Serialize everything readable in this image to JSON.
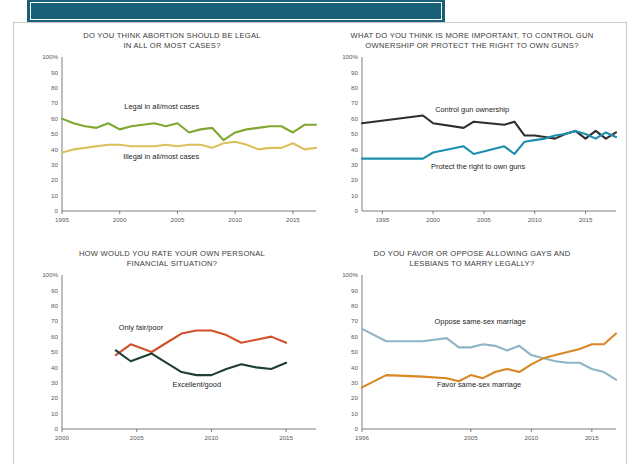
{
  "banner": {
    "title": ""
  },
  "panels": [
    {
      "id": "abortion",
      "title": "DO YOU THINK ABORTION SHOULD BE LEGAL IN ALL OR MOST CASES?",
      "title_line1": "DO YOU THINK ABORTION SHOULD BE LEGAL",
      "title_line2": "IN ALL OR MOST CASES?"
    },
    {
      "id": "guns",
      "title": "WHAT DO YOU THINK IS MORE IMPORTANT, TO CONTROL GUN OWNERSHIP OR PROTECT THE RIGHT TO OWN GUNS?",
      "title_line1": "WHAT DO YOU THINK IS MORE IMPORTANT, TO CONTROL GUN",
      "title_line2": "OWNERSHIP OR PROTECT THE RIGHT TO OWN GUNS?"
    },
    {
      "id": "finance",
      "title": "HOW WOULD YOU RATE YOUR OWN PERSONAL FINANCIAL SITUATION?",
      "title_line1": "HOW WOULD YOU RATE YOUR OWN PERSONAL",
      "title_line2": "FINANCIAL SITUATION?"
    },
    {
      "id": "marriage",
      "title": "DO YOU FAVOR OR OPPOSE ALLOWING GAYS AND LESBIANS TO MARRY LEGALLY?",
      "title_line1": "DO YOU FAVOR OR OPPOSE ALLOWING GAYS AND",
      "title_line2": "LESBIANS TO MARRY LEGALLY?"
    }
  ],
  "chart_data": [
    {
      "id": "abortion",
      "type": "line",
      "title": "DO YOU THINK ABORTION SHOULD BE LEGAL IN ALL OR MOST CASES?",
      "xlabel": "",
      "ylabel": "",
      "ylim": [
        0,
        100
      ],
      "xlim": [
        1995,
        2017
      ],
      "yticks": [
        0,
        10,
        20,
        30,
        40,
        50,
        60,
        70,
        80,
        90,
        100
      ],
      "ytick_labels": [
        "0",
        "10",
        "20",
        "30",
        "40",
        "50",
        "60",
        "70",
        "80",
        "90",
        "100%"
      ],
      "xticks": [
        1995,
        2000,
        2005,
        2010,
        2015
      ],
      "xtick_labels": [
        "1995",
        "2000",
        "2005",
        "2010",
        "2015"
      ],
      "grid": false,
      "legend_position": "inline-annotation",
      "series": [
        {
          "name": "Legal in all/most cases",
          "color": "#7fa830",
          "label_x": 2000.4,
          "label_y": 66,
          "x": [
            1995,
            1996,
            1997,
            1998,
            1999,
            2000,
            2001,
            2002,
            2003,
            2004,
            2005,
            2006,
            2007,
            2008,
            2009,
            2010,
            2011,
            2012,
            2013,
            2014,
            2015,
            2016,
            2017
          ],
          "values": [
            60,
            57,
            55,
            54,
            57,
            53,
            55,
            56,
            57,
            55,
            57,
            51,
            53,
            54,
            46,
            51,
            53,
            54,
            55,
            55,
            51,
            56,
            56
          ]
        },
        {
          "name": "Illegal in all/most cases",
          "color": "#dcc05c",
          "label_x": 2000.3,
          "label_y": 34,
          "x": [
            1995,
            1996,
            1997,
            1998,
            1999,
            2000,
            2001,
            2002,
            2003,
            2004,
            2005,
            2006,
            2007,
            2008,
            2009,
            2010,
            2011,
            2012,
            2013,
            2014,
            2015,
            2016,
            2017
          ],
          "values": [
            38,
            40,
            41,
            42,
            43,
            43,
            42,
            42,
            42,
            43,
            42,
            43,
            43,
            41,
            44,
            45,
            43,
            40,
            41,
            41,
            44,
            40,
            41
          ]
        }
      ]
    },
    {
      "id": "guns",
      "type": "line",
      "title": "WHAT DO YOU THINK IS MORE IMPORTANT, TO CONTROL GUN OWNERSHIP OR PROTECT THE RIGHT TO OWN GUNS?",
      "xlabel": "",
      "ylabel": "",
      "ylim": [
        0,
        100
      ],
      "xlim": [
        1993,
        2018
      ],
      "yticks": [
        0,
        10,
        20,
        30,
        40,
        50,
        60,
        70,
        80,
        90,
        100
      ],
      "ytick_labels": [
        "0",
        "10",
        "20",
        "30",
        "40",
        "50",
        "60",
        "70",
        "80",
        "90",
        "100%"
      ],
      "xticks": [
        1995,
        2000,
        2005,
        2010,
        2015
      ],
      "xtick_labels": [
        "1995",
        "2000",
        "2005",
        "2010",
        "2015"
      ],
      "grid": false,
      "legend_position": "inline-annotation",
      "series": [
        {
          "name": "Control gun ownership",
          "color": "#2e2e2e",
          "label_x": 2000.2,
          "label_y": 64,
          "x": [
            1993,
            1999,
            2000,
            2003,
            2004,
            2007,
            2008,
            2009,
            2010,
            2011,
            2012,
            2013,
            2014,
            2015,
            2016,
            2017,
            2018
          ],
          "values": [
            57,
            62,
            57,
            54,
            58,
            56,
            58,
            49,
            49,
            48,
            47,
            50,
            52,
            47,
            52,
            47,
            51
          ]
        },
        {
          "name": "Protect the right to own guns",
          "color": "#1b8fae",
          "label_x": 1999.8,
          "label_y": 27,
          "x": [
            1993,
            1999,
            2000,
            2003,
            2004,
            2007,
            2008,
            2009,
            2010,
            2011,
            2012,
            2013,
            2014,
            2015,
            2016,
            2017,
            2018
          ],
          "values": [
            34,
            34,
            38,
            42,
            37,
            42,
            37,
            45,
            46,
            47,
            49,
            50,
            52,
            50,
            47,
            51,
            48
          ]
        }
      ]
    },
    {
      "id": "finance",
      "type": "line",
      "title": "HOW WOULD YOU RATE YOUR OWN PERSONAL FINANCIAL SITUATION?",
      "xlabel": "",
      "ylabel": "",
      "ylim": [
        0,
        100
      ],
      "xlim": [
        2000,
        2017
      ],
      "yticks": [
        0,
        10,
        20,
        30,
        40,
        50,
        60,
        70,
        80,
        90,
        100
      ],
      "ytick_labels": [
        "0",
        "10",
        "20",
        "30",
        "40",
        "50",
        "60",
        "70",
        "80",
        "90",
        "100%"
      ],
      "xticks": [
        2000,
        2005,
        2010,
        2015
      ],
      "xtick_labels": [
        "2000",
        "2005",
        "2010",
        "2015"
      ],
      "grid": false,
      "legend_position": "inline-annotation",
      "series": [
        {
          "name": "Only fair/poor",
          "color": "#d1512a",
          "label_x": 2003.8,
          "label_y": 64,
          "x": [
            2003.6,
            2004.6,
            2006,
            2007,
            2008,
            2009,
            2010,
            2011,
            2012,
            2013,
            2014,
            2015
          ],
          "values": [
            48,
            55,
            50,
            56,
            62,
            64,
            64,
            61,
            56,
            58,
            60,
            56
          ]
        },
        {
          "name": "Excellent/good",
          "color": "#1d4033",
          "label_x": 2007.4,
          "label_y": 27,
          "x": [
            2003.6,
            2004.6,
            2006,
            2007,
            2008,
            2009,
            2010,
            2011,
            2012,
            2013,
            2014,
            2015
          ],
          "values": [
            51,
            44,
            49,
            43,
            37,
            35,
            35,
            39,
            42,
            40,
            39,
            43
          ]
        }
      ]
    },
    {
      "id": "marriage",
      "type": "line",
      "title": "DO YOU FAVOR OR OPPOSE ALLOWING GAYS AND LESBIANS TO MARRY LEGALLY?",
      "xlabel": "",
      "ylabel": "",
      "ylim": [
        0,
        100
      ],
      "xlim": [
        1996,
        2017
      ],
      "yticks": [
        0,
        10,
        20,
        30,
        40,
        50,
        60,
        70,
        80,
        90,
        100
      ],
      "ytick_labels": [
        "0",
        "10",
        "20",
        "30",
        "40",
        "50",
        "60",
        "70",
        "80",
        "90",
        "100%"
      ],
      "xticks": [
        1996,
        2005,
        2010,
        2015
      ],
      "xtick_labels": [
        "1996",
        "2005",
        "2010",
        "2015"
      ],
      "grid": false,
      "legend_position": "inline-annotation",
      "series": [
        {
          "name": "Oppose same-sex marriage",
          "color": "#8fb5c4",
          "label_x": 2002.0,
          "label_y": 68,
          "x": [
            1996,
            1998,
            2001,
            2003,
            2004,
            2005,
            2006,
            2007,
            2008,
            2009,
            2010,
            2011,
            2012,
            2013,
            2014,
            2015,
            2016,
            2017
          ],
          "values": [
            65,
            57,
            57,
            59,
            53,
            53,
            55,
            54,
            51,
            54,
            48,
            46,
            44,
            43,
            43,
            39,
            37,
            32
          ]
        },
        {
          "name": "Favor same-sex marriage",
          "color": "#d98624",
          "label_x": 2002.2,
          "label_y": 27,
          "x": [
            1996,
            1998,
            2001,
            2003,
            2004,
            2005,
            2006,
            2007,
            2008,
            2009,
            2010,
            2011,
            2012,
            2013,
            2014,
            2015,
            2016,
            2017
          ],
          "values": [
            27,
            35,
            34,
            33,
            31,
            35,
            33,
            37,
            39,
            37,
            42,
            46,
            48,
            50,
            52,
            55,
            55,
            62
          ]
        }
      ]
    }
  ]
}
